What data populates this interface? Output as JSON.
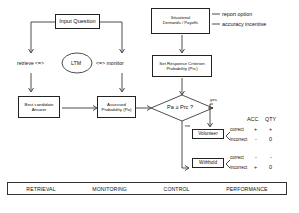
{
  "diagram": {
    "input_question": "Input Question",
    "retrieve_label": "retrieve <=>",
    "ltm": "LTM",
    "monitor_label": "<=> monitor",
    "best_candidate": [
      "Best candidate",
      "Answer"
    ],
    "assessed_probability": [
      "Assessed",
      "Probability (Pa)"
    ],
    "situational_demands": [
      "Situational",
      "Demands / Payoffs"
    ],
    "report_option": "report option",
    "accuracy_incentive": "accuracy incentive",
    "set_response_criterion": [
      "Set Response Criterion",
      "Probability (Prc)"
    ],
    "decision": "Pa ≥ Prc ?",
    "yes_label": "yes",
    "no_label": "no",
    "volunteer": "Volunteer",
    "withhold": "Withhold",
    "outcome_table": {
      "headers": [
        "ACC",
        "QTY"
      ],
      "rows": [
        {
          "action": "Volunteer",
          "outcome": "correct",
          "acc": "+",
          "qty": "+"
        },
        {
          "action": "Volunteer",
          "outcome": "incorrect",
          "acc": "-",
          "qty": "0"
        },
        {
          "action": "Withhold",
          "outcome": "correct",
          "acc": "-",
          "qty": "-"
        },
        {
          "action": "Withhold",
          "outcome": "incorrect",
          "acc": "+",
          "qty": "0"
        }
      ]
    }
  },
  "stages": [
    "RETRIEVAL",
    "MONITORING",
    "CONTROL",
    "PERFORMANCE"
  ]
}
